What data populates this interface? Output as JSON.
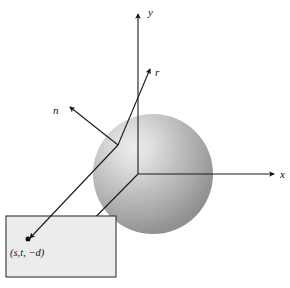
{
  "figure": {
    "background_color": "#ffffff",
    "line_color": "#1a1a1a",
    "plane_fill_color": "#ececec",
    "sphere_light_color": "#e4e4e4",
    "sphere_mid_color": "#b3b3b3",
    "sphere_dark_color": "#8a8a8a"
  },
  "axes": {
    "x": {
      "label": "x",
      "label_x": 280,
      "label_y": 176
    },
    "y": {
      "label": "y",
      "label_x": 148,
      "label_y": 16
    },
    "z": {
      "label": "z",
      "label_x": 73,
      "label_y": 256
    }
  },
  "vectors": {
    "reflected": {
      "label": "r",
      "label_x": 155,
      "label_y": 73
    },
    "normal": {
      "label": "n",
      "label_x": 56,
      "label_y": 113
    }
  },
  "plane": {
    "point_label": "(s,t, −d)",
    "point_label_x": 10,
    "point_label_y": 254
  }
}
